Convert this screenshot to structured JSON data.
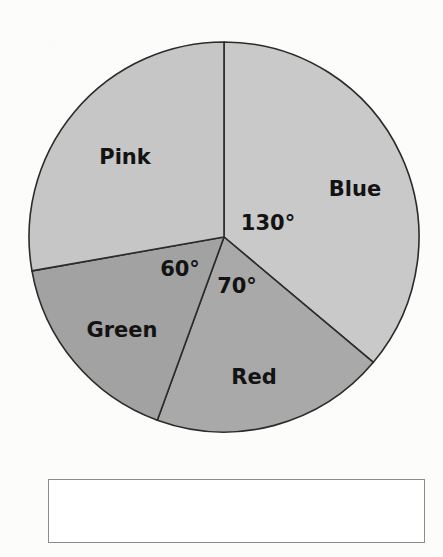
{
  "chart_data": {
    "type": "pie",
    "title": "",
    "subtitle": "",
    "xlabel": "",
    "ylabel": "",
    "legend_position": "none",
    "grid": false,
    "units": "degrees",
    "total_degrees": 360,
    "start_angle_deg": 0,
    "direction": "clockwise",
    "categories": [
      "Blue",
      "Red",
      "Green",
      "Pink"
    ],
    "values": [
      130,
      70,
      60,
      100
    ],
    "value_suffix": "°",
    "annotations": [
      "130°",
      "70°",
      "60°"
    ],
    "slices": [
      {
        "label": "Blue",
        "angle_deg": 130,
        "angle_text": "130°",
        "angle_labeled": true,
        "fill": "#c9c9c9",
        "stroke": "#2b2b2b",
        "start_deg": 0,
        "end_deg": 130,
        "label_x": 355,
        "label_y": 190,
        "label_anchor": "middle",
        "angle_label_x": 268,
        "angle_label_y": 224,
        "angle_label_anchor": "middle"
      },
      {
        "label": "Red",
        "angle_deg": 70,
        "angle_text": "70°",
        "angle_labeled": true,
        "fill": "#a9a9a9",
        "stroke": "#2b2b2b",
        "start_deg": 130,
        "end_deg": 200,
        "label_x": 254,
        "label_y": 378,
        "label_anchor": "middle",
        "angle_label_x": 237,
        "angle_label_y": 287,
        "angle_label_anchor": "middle"
      },
      {
        "label": "Green",
        "angle_deg": 60,
        "angle_text": "60°",
        "angle_labeled": true,
        "fill": "#a2a2a2",
        "stroke": "#2b2b2b",
        "start_deg": 200,
        "end_deg": 260,
        "label_x": 122,
        "label_y": 331,
        "label_anchor": "middle",
        "angle_label_x": 180,
        "angle_label_y": 270,
        "angle_label_anchor": "middle"
      },
      {
        "label": "Pink",
        "angle_deg": 100,
        "angle_text": "",
        "angle_labeled": false,
        "fill": "#c6c6c6",
        "stroke": "#2b2b2b",
        "start_deg": 260,
        "end_deg": 360,
        "label_x": 125,
        "label_y": 158,
        "label_anchor": "middle",
        "angle_label_x": 0,
        "angle_label_y": 0,
        "angle_label_anchor": "middle"
      }
    ],
    "geometry": {
      "center_x": 224,
      "center_y": 237,
      "radius": 195
    }
  },
  "answer_box": {
    "value": "",
    "placeholder": ""
  },
  "colors": {
    "slice_blue": "#c9c9c9",
    "slice_red": "#a9a9a9",
    "slice_green": "#a2a2a2",
    "slice_pink": "#c6c6c6",
    "outline": "#2b2b2b",
    "text": "#131313",
    "box_border": "#8c8c8c",
    "page_background": "#fcfcfb"
  }
}
